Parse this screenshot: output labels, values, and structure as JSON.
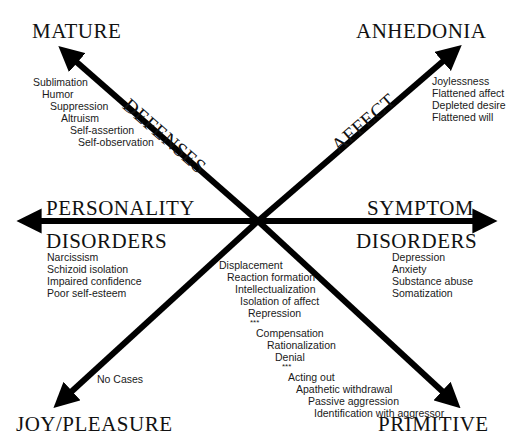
{
  "corners": {
    "top_left": "MATURE",
    "top_right": "ANHEDONIA",
    "bottom_left": "JOY/PLEASURE",
    "bottom_right": "PRIMITIVE"
  },
  "axes": {
    "defenses": "DEFENSES",
    "affect": "AFFECT",
    "personality_top": "PERSONALITY",
    "personality_bottom": "DISORDERS",
    "symptom_top": "SYMPTOM",
    "symptom_bottom": "DISORDERS"
  },
  "lists": {
    "mature_defenses": [
      "Sublimation",
      "Humor",
      "Suppression",
      "Altruism",
      "Self-assertion",
      "Self-observation"
    ],
    "anhedonia_items": [
      "Joylessness",
      "Flattened affect",
      "Depleted desire",
      "Flattened will"
    ],
    "personality_disorders": [
      "Narcissism",
      "Schizoid isolation",
      "Impaired confidence",
      "Poor self-esteem"
    ],
    "symptom_disorders": [
      "Depression",
      "Anxiety",
      "Substance abuse",
      "Somatization"
    ],
    "joy_items": [
      "No Cases"
    ],
    "primitive_defenses": [
      "Displacement",
      "Reaction formation",
      "Intellectualization",
      "Isolation of affect",
      "Repression",
      "***",
      "Compensation",
      "Rationalization",
      "Denial",
      "***",
      "Acting out",
      "Apathetic withdrawal",
      "Passive aggression",
      "Identification with aggressor"
    ]
  },
  "colors": {
    "arrow": "#000000",
    "text": "#1a1a1a",
    "background": "#ffffff"
  }
}
